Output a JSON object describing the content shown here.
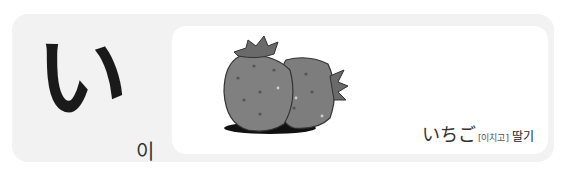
{
  "letter": {
    "kana": "い",
    "reading": "이"
  },
  "example": {
    "illustration": "strawberry-illustration",
    "word": "いちご",
    "korean_reading": "[이치고]",
    "meaning": "딸기"
  },
  "colors": {
    "panel_bg": "#f2f2f2",
    "card_bg": "#ffffff",
    "strawberry": "#7d7d7d",
    "leaf": "#6a6a6a"
  }
}
